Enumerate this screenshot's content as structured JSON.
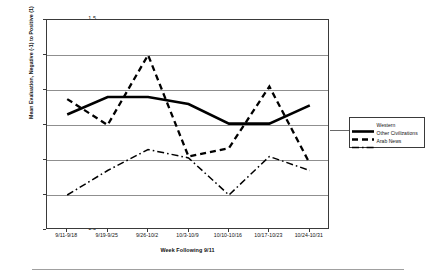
{
  "chart_data": {
    "type": "line",
    "title": "",
    "xlabel": "Week Following 9/11",
    "ylabel": "Mean Evaluation, Negative (-1) to Positive (1)",
    "categories": [
      "9/11-9/18",
      "9/19-9/25",
      "9/26-10/2",
      "10/3-10/9",
      "10/10-10/16",
      "10/17-10/23",
      "10/24-10/31"
    ],
    "ylim": [
      -1.5,
      1.5
    ],
    "yticks": [
      1.5,
      1,
      0.5,
      0,
      -0.5,
      -1,
      -1.5
    ],
    "ytick_labels": [
      "1.5",
      "1",
      "0.5",
      "0",
      "-0.5",
      "-1",
      "-1.5"
    ],
    "grid": true,
    "legend_position": "right",
    "series": [
      {
        "name": "Western",
        "style": "solid",
        "color": "#000000",
        "values": [
          0.15,
          0.4,
          0.4,
          0.3,
          0.02,
          0.02,
          0.28
        ]
      },
      {
        "name": "Other Civilizations",
        "style": "dashed",
        "color": "#000000",
        "values": [
          0.37,
          0.0,
          1.0,
          -0.45,
          -0.33,
          0.55,
          -0.55
        ]
      },
      {
        "name": "Arab News",
        "style": "dashdot",
        "color": "#000000",
        "values": [
          -1.0,
          -0.65,
          -0.35,
          -0.47,
          -1.0,
          -0.45,
          -0.65
        ]
      }
    ]
  },
  "legend": {
    "items": [
      {
        "label": "Western"
      },
      {
        "label": "Other Civilizations"
      },
      {
        "label": "Arab News"
      }
    ]
  }
}
